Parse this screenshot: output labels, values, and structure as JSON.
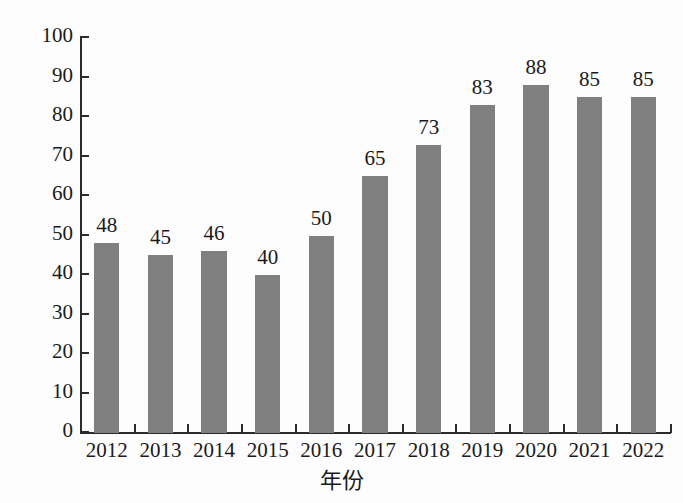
{
  "chart_data": {
    "type": "bar",
    "title": "",
    "xlabel": "年份",
    "ylabel": "需求量(百万吨)",
    "categories": [
      "2012",
      "2013",
      "2014",
      "2015",
      "2016",
      "2017",
      "2018",
      "2019",
      "2020",
      "2021",
      "2022"
    ],
    "values": [
      48,
      45,
      46,
      40,
      50,
      65,
      73,
      83,
      88,
      85,
      85
    ],
    "value_labels": [
      "48",
      "45",
      "46",
      "40",
      "50",
      "65",
      "73",
      "83",
      "88",
      "85",
      "85"
    ],
    "ylim": [
      0,
      100
    ],
    "ytick_values": [
      0,
      10,
      20,
      30,
      40,
      50,
      60,
      70,
      80,
      90,
      100
    ],
    "ytick_labels": [
      "0",
      "10",
      "20",
      "30",
      "40",
      "50",
      "60",
      "70",
      "80",
      "90",
      "100"
    ],
    "grid": false,
    "legend": null,
    "legend_position": "none",
    "bar_color": "#808080",
    "axis_color": "#2b2b2b",
    "text_color": "#1a1a1a",
    "background_color": "#ffffff"
  }
}
